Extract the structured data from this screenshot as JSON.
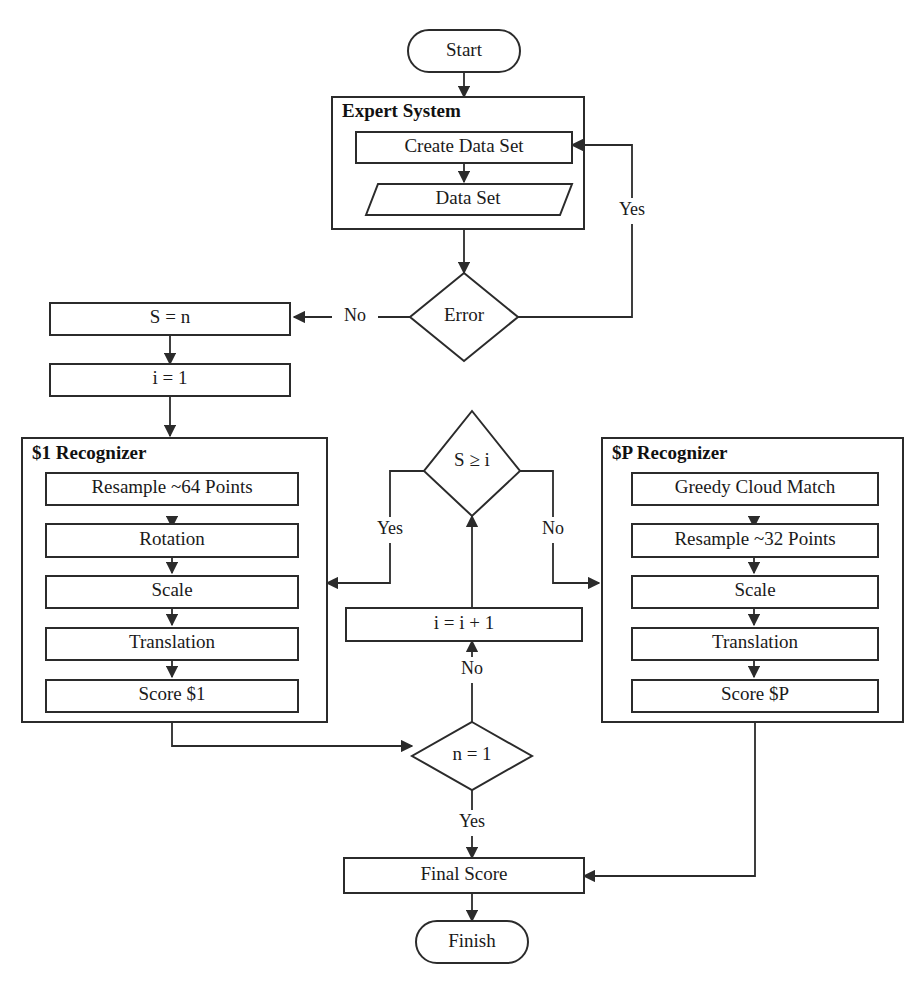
{
  "diagram": {
    "background_color": "#ffffff",
    "stroke_color": "#2b2b2b",
    "text_color": "#1a1a1a"
  },
  "nodes": {
    "start": {
      "label": "Start",
      "shape": "terminator"
    },
    "expert_system": {
      "label": "Expert System",
      "shape": "group"
    },
    "create_data_set": {
      "label": "Create Data Set",
      "shape": "process"
    },
    "data_set": {
      "label": "Data Set",
      "shape": "data-parallelogram"
    },
    "error": {
      "label": "Error",
      "shape": "decision"
    },
    "s_equals_n": {
      "label": "S = n",
      "shape": "process"
    },
    "i_equals_1": {
      "label": "i = 1",
      "shape": "process"
    },
    "recognizer_1": {
      "label": "$1 Recognizer",
      "shape": "group"
    },
    "r1_resample": {
      "label": "Resample ~64 Points",
      "shape": "process"
    },
    "r1_rotation": {
      "label": "Rotation",
      "shape": "process"
    },
    "r1_scale": {
      "label": "Scale",
      "shape": "process"
    },
    "r1_translation": {
      "label": "Translation",
      "shape": "process"
    },
    "r1_score": {
      "label": "Score $1",
      "shape": "process"
    },
    "recognizer_p": {
      "label": "$P Recognizer",
      "shape": "group"
    },
    "rp_greedy": {
      "label": "Greedy Cloud Match",
      "shape": "process"
    },
    "rp_resample": {
      "label": "Resample ~32 Points",
      "shape": "process"
    },
    "rp_scale": {
      "label": "Scale",
      "shape": "process"
    },
    "rp_translation": {
      "label": "Translation",
      "shape": "process"
    },
    "rp_score": {
      "label": "Score $P",
      "shape": "process"
    },
    "s_ge_i": {
      "label": "S ≥ i",
      "shape": "decision"
    },
    "i_increment": {
      "label": "i = i + 1",
      "shape": "process"
    },
    "n_equals_1": {
      "label": "n = 1",
      "shape": "decision"
    },
    "final_score": {
      "label": "Final Score",
      "shape": "process"
    },
    "finish": {
      "label": "Finish",
      "shape": "terminator"
    }
  },
  "edge_labels": {
    "error_yes": "Yes",
    "error_no": "No",
    "sgei_yes": "Yes",
    "sgei_no": "No",
    "n1_no": "No",
    "n1_yes": "Yes"
  }
}
